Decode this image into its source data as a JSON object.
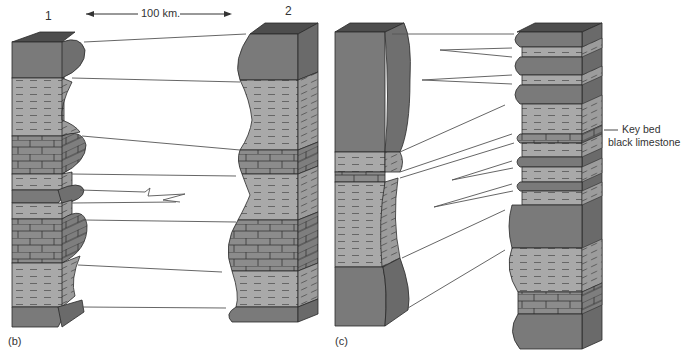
{
  "panel_b": {
    "label": "(b)",
    "column1_label": "1",
    "column2_label": "2",
    "distance_label": "100 km."
  },
  "panel_c": {
    "label": "(c)",
    "key_bed_line1": "Key bed",
    "key_bed_line2": "black limestone"
  },
  "colors": {
    "top_face": "#4d4d4d",
    "sandstone": "#7a7a7a",
    "sandstone_side": "#6b6b6b",
    "shale": "#a9a9a9",
    "shale_side": "#9a9a9a",
    "limestone": "#8c8c8c",
    "outline": "#2a2a2a",
    "line": "#555555"
  }
}
